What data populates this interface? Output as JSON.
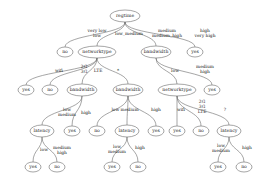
{
  "diagram": {
    "nodes": [
      {
        "id": "n0",
        "label": "regtime",
        "x": 125,
        "y": 16,
        "rx": 15,
        "ry": 6
      },
      {
        "id": "n1",
        "label": "no",
        "x": 65,
        "y": 52,
        "rx": 8,
        "ry": 5
      },
      {
        "id": "n2",
        "label": "networktype",
        "x": 97,
        "y": 52,
        "rx": 19,
        "ry": 6
      },
      {
        "id": "n3",
        "label": "bandwidth",
        "x": 156,
        "y": 52,
        "rx": 15,
        "ry": 6
      },
      {
        "id": "n4",
        "label": "yes",
        "x": 195,
        "y": 52,
        "rx": 8,
        "ry": 5
      },
      {
        "id": "n5",
        "label": "yes",
        "x": 26,
        "y": 90,
        "rx": 8,
        "ry": 5
      },
      {
        "id": "n6",
        "label": "no",
        "x": 50,
        "y": 90,
        "rx": 8,
        "ry": 5
      },
      {
        "id": "n7",
        "label": "bandwidth",
        "x": 82,
        "y": 90,
        "rx": 15,
        "ry": 6
      },
      {
        "id": "n8",
        "label": "bandwidth",
        "x": 128,
        "y": 90,
        "rx": 15,
        "ry": 6
      },
      {
        "id": "n9",
        "label": "networktype",
        "x": 177,
        "y": 90,
        "rx": 19,
        "ry": 6
      },
      {
        "id": "n10",
        "label": "yes",
        "x": 212,
        "y": 90,
        "rx": 8,
        "ry": 5
      },
      {
        "id": "n11",
        "label": "latency",
        "x": 42,
        "y": 131,
        "rx": 12,
        "ry": 6
      },
      {
        "id": "n12",
        "label": "yes",
        "x": 72,
        "y": 131,
        "rx": 8,
        "ry": 5
      },
      {
        "id": "n13",
        "label": "no",
        "x": 97,
        "y": 131,
        "rx": 8,
        "ry": 5
      },
      {
        "id": "n14",
        "label": "latency",
        "x": 127,
        "y": 131,
        "rx": 12,
        "ry": 6
      },
      {
        "id": "n15",
        "label": "yes",
        "x": 156,
        "y": 131,
        "rx": 8,
        "ry": 5
      },
      {
        "id": "n16",
        "label": "yes",
        "x": 177,
        "y": 131,
        "rx": 8,
        "ry": 5
      },
      {
        "id": "n17",
        "label": "no",
        "x": 201,
        "y": 131,
        "rx": 8,
        "ry": 5
      },
      {
        "id": "n18",
        "label": "latency",
        "x": 229,
        "y": 131,
        "rx": 12,
        "ry": 6
      },
      {
        "id": "n19",
        "label": "yes",
        "x": 33,
        "y": 167,
        "rx": 8,
        "ry": 5
      },
      {
        "id": "n20",
        "label": "no",
        "x": 57,
        "y": 167,
        "rx": 8,
        "ry": 5
      },
      {
        "id": "n21",
        "label": "yes",
        "x": 112,
        "y": 167,
        "rx": 8,
        "ry": 5
      },
      {
        "id": "n22",
        "label": "no",
        "x": 138,
        "y": 167,
        "rx": 8,
        "ry": 5
      },
      {
        "id": "n23",
        "label": "yes",
        "x": 218,
        "y": 167,
        "rx": 8,
        "ry": 5
      },
      {
        "id": "n24",
        "label": "no",
        "x": 244,
        "y": 167,
        "rx": 8,
        "ry": 5
      }
    ],
    "edges": [
      {
        "from": "n0",
        "to": "n1",
        "label": [
          "very low",
          "low"
        ],
        "lx": 97,
        "ly": 33
      },
      {
        "from": "n0",
        "to": "n2",
        "label": [
          "low_medium"
        ],
        "lx": 129,
        "ly": 34
      },
      {
        "from": "n0",
        "to": "n3",
        "label": [
          "medium",
          "medium_high"
        ],
        "lx": 167,
        "ly": 33
      },
      {
        "from": "n0",
        "to": "n4",
        "label": [
          "high",
          "very high"
        ],
        "lx": 205,
        "ly": 33
      },
      {
        "from": "n2",
        "to": "n5",
        "label": [
          "wifi"
        ],
        "lx": 59,
        "ly": 71
      },
      {
        "from": "n2",
        "to": "n6",
        "label": [
          "2G",
          "3G"
        ],
        "lx": 84,
        "ly": 69
      },
      {
        "from": "n2",
        "to": "n7",
        "label": [
          "LTE"
        ],
        "lx": 98,
        "ly": 71
      },
      {
        "from": "n2",
        "to": "n8",
        "label": [
          "*"
        ],
        "lx": 118,
        "ly": 71
      },
      {
        "from": "n3",
        "to": "n9",
        "label": [
          "low"
        ],
        "lx": 175,
        "ly": 71
      },
      {
        "from": "n3",
        "to": "n10",
        "label": [
          "medium",
          "high"
        ],
        "lx": 205,
        "ly": 69
      },
      {
        "from": "n7",
        "to": "n11",
        "label": [
          "low",
          "medium"
        ],
        "lx": 67,
        "ly": 112
      },
      {
        "from": "n7",
        "to": "n12",
        "label": [
          "high"
        ],
        "lx": 86,
        "ly": 113
      },
      {
        "from": "n8",
        "to": "n13",
        "label": [
          ""
        ],
        "lx": 0,
        "ly": 0
      },
      {
        "from": "n8",
        "to": "n14",
        "label": [
          "low medium"
        ],
        "lx": 125,
        "ly": 110
      },
      {
        "from": "n8",
        "to": "n15",
        "label": [
          "high"
        ],
        "lx": 156,
        "ly": 110
      },
      {
        "from": "n9",
        "to": "n16",
        "label": [
          "wifi"
        ],
        "lx": 181,
        "ly": 110
      },
      {
        "from": "n9",
        "to": "n17",
        "label": [
          "2G",
          "3G",
          "LTE"
        ],
        "lx": 202,
        "ly": 107
      },
      {
        "from": "n9",
        "to": "n18",
        "label": [
          "?"
        ],
        "lx": 225,
        "ly": 110
      },
      {
        "from": "n11",
        "to": "n19",
        "label": [
          "low"
        ],
        "lx": 44,
        "ly": 150
      },
      {
        "from": "n11",
        "to": "n20",
        "label": [
          "medium",
          "high"
        ],
        "lx": 62,
        "ly": 150
      },
      {
        "from": "n14",
        "to": "n21",
        "label": [
          "low",
          "medium"
        ],
        "lx": 117,
        "ly": 149
      },
      {
        "from": "n14",
        "to": "n22",
        "label": [
          "high"
        ],
        "lx": 140,
        "ly": 148
      },
      {
        "from": "n18",
        "to": "n23",
        "label": [
          "low",
          "medium"
        ],
        "lx": 221,
        "ly": 148
      },
      {
        "from": "n18",
        "to": "n24",
        "label": [
          "high"
        ],
        "lx": 247,
        "ly": 148
      }
    ]
  }
}
